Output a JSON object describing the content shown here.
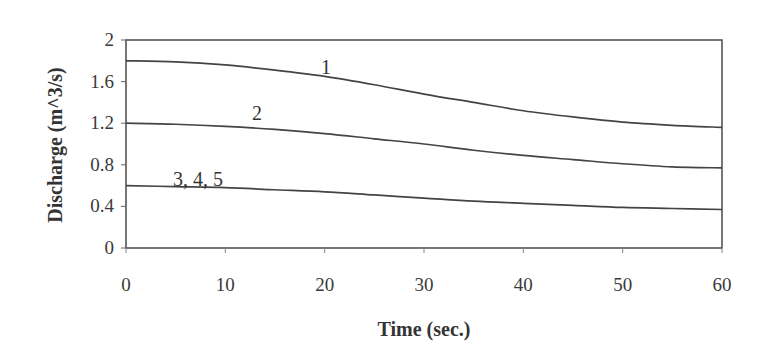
{
  "chart_data": {
    "type": "line",
    "title": "",
    "xlabel": "Time (sec.)",
    "ylabel": "Discharge (m^3/s)",
    "xlim": [
      0,
      60
    ],
    "ylim": [
      0,
      2
    ],
    "xticks": [
      0,
      10,
      20,
      30,
      40,
      50,
      60
    ],
    "yticks": [
      0,
      0.4,
      0.8,
      1.2,
      1.6,
      2
    ],
    "grid": false,
    "legend": "none (inline curve labels)",
    "x": [
      0,
      5,
      10,
      15,
      20,
      25,
      30,
      35,
      40,
      45,
      50,
      55,
      60
    ],
    "series": [
      {
        "name": "1",
        "label_text": "1",
        "values": [
          1.8,
          1.79,
          1.76,
          1.71,
          1.65,
          1.57,
          1.48,
          1.4,
          1.32,
          1.26,
          1.21,
          1.18,
          1.16
        ]
      },
      {
        "name": "2",
        "label_text": "2",
        "values": [
          1.2,
          1.19,
          1.17,
          1.14,
          1.1,
          1.05,
          1.0,
          0.94,
          0.89,
          0.85,
          0.81,
          0.78,
          0.77
        ]
      },
      {
        "name": "3, 4, 5",
        "label_text": "3, 4, 5",
        "values": [
          0.6,
          0.59,
          0.58,
          0.56,
          0.54,
          0.51,
          0.48,
          0.45,
          0.43,
          0.41,
          0.39,
          0.38,
          0.37
        ]
      }
    ]
  }
}
